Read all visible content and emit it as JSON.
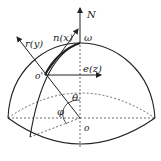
{
  "diagram": {
    "type": "hemisphere-coordinate-system",
    "labels": {
      "north": "N",
      "omega": "ω",
      "r_axis": "r(y)",
      "n_axis": "n(x)",
      "e_axis": "e(z)",
      "point_o_prime": "o'",
      "center_o": "o",
      "theta": "θ",
      "phi": "φ"
    },
    "colors": {
      "stroke": "#222222",
      "background": "#ffffff"
    }
  }
}
